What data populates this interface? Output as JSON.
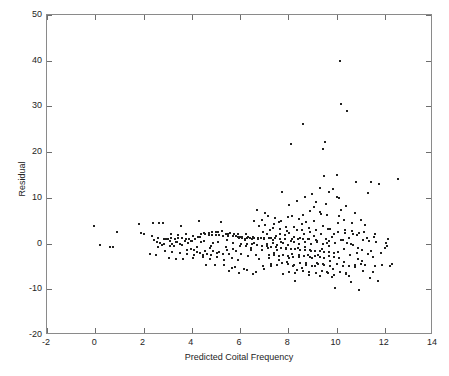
{
  "chart_data": {
    "type": "scatter",
    "title": "",
    "xlabel": "Predicted Coital Frequency",
    "ylabel": "Residual",
    "xlim": [
      -2,
      14
    ],
    "ylim": [
      -20,
      50
    ],
    "xticks": [
      -2,
      0,
      2,
      4,
      6,
      8,
      10,
      12,
      14
    ],
    "xticklabels": [
      "-2",
      "0",
      "2",
      "4",
      "6",
      "8",
      "10",
      "12",
      "14"
    ],
    "yticks": [
      -20,
      -10,
      0,
      10,
      20,
      30,
      40,
      50
    ],
    "yticklabels": [
      "-20",
      "-10",
      "0",
      "10",
      "20",
      "30",
      "40",
      "50"
    ],
    "grid": false,
    "legend": null,
    "marker": "point",
    "marker_color": "#20201f",
    "marker_size_px": 2,
    "axes_color": "#8a8a8a",
    "background": "#ffffff",
    "n_points": 420,
    "points": [
      [
        -0.05,
        3.8
      ],
      [
        0.2,
        -0.3
      ],
      [
        0.6,
        -0.7
      ],
      [
        0.75,
        -0.8
      ],
      [
        0.9,
        2.6
      ],
      [
        1.8,
        4.2
      ],
      [
        1.9,
        2.3
      ],
      [
        2.0,
        2.2
      ],
      [
        2.25,
        -2.3
      ],
      [
        2.35,
        1.7
      ],
      [
        2.4,
        4.4
      ],
      [
        2.45,
        0.8
      ],
      [
        2.5,
        -2.5
      ],
      [
        2.6,
        1.2
      ],
      [
        2.65,
        4.6
      ],
      [
        2.7,
        0.2
      ],
      [
        2.8,
        4.6
      ],
      [
        2.85,
        1.0
      ],
      [
        2.9,
        0.9
      ],
      [
        2.95,
        1.1
      ],
      [
        3.0,
        1.0
      ],
      [
        3.05,
        -3.2
      ],
      [
        3.1,
        0.6
      ],
      [
        3.15,
        1.3
      ],
      [
        3.2,
        -0.2
      ],
      [
        3.3,
        1.1
      ],
      [
        3.35,
        -3.4
      ],
      [
        3.4,
        0.3
      ],
      [
        3.45,
        1.2
      ],
      [
        3.5,
        0.0
      ],
      [
        3.55,
        3.8
      ],
      [
        3.6,
        1.3
      ],
      [
        3.65,
        -3.4
      ],
      [
        3.7,
        0.5
      ],
      [
        3.75,
        1.0
      ],
      [
        3.8,
        -1.4
      ],
      [
        3.9,
        0.9
      ],
      [
        3.95,
        -1.2
      ],
      [
        4.0,
        0.6
      ],
      [
        4.05,
        -3.2
      ],
      [
        4.1,
        -2.6
      ],
      [
        4.15,
        0.9
      ],
      [
        4.2,
        -1.9
      ],
      [
        4.3,
        5.0
      ],
      [
        4.35,
        -2.0
      ],
      [
        4.4,
        0.3
      ],
      [
        4.45,
        -2.4
      ],
      [
        4.5,
        2.3
      ],
      [
        4.55,
        -1.7
      ],
      [
        4.6,
        -4.6
      ],
      [
        4.65,
        -2.2
      ],
      [
        4.7,
        2.4
      ],
      [
        4.75,
        -1.0
      ],
      [
        4.8,
        -2.5
      ],
      [
        4.85,
        2.5
      ],
      [
        4.9,
        -1.6
      ],
      [
        4.95,
        -4.7
      ],
      [
        5.0,
        2.5
      ],
      [
        5.05,
        -2.1
      ],
      [
        5.1,
        2.6
      ],
      [
        5.15,
        -1.9
      ],
      [
        5.2,
        4.8
      ],
      [
        5.25,
        2.7
      ],
      [
        5.3,
        -2.3
      ],
      [
        5.35,
        -4.6
      ],
      [
        5.4,
        2.2
      ],
      [
        5.45,
        -1.5
      ],
      [
        5.5,
        2.2
      ],
      [
        5.55,
        -2.2
      ],
      [
        5.6,
        2.3
      ],
      [
        5.65,
        -5.4
      ],
      [
        5.7,
        -1.2
      ],
      [
        5.75,
        2.2
      ],
      [
        5.8,
        -5.2
      ],
      [
        5.85,
        -1.6
      ],
      [
        5.9,
        2.1
      ],
      [
        5.95,
        1.3
      ],
      [
        6.0,
        1.4
      ],
      [
        6.05,
        -2.2
      ],
      [
        6.1,
        1.3
      ],
      [
        6.15,
        -5.5
      ],
      [
        6.2,
        1.1
      ],
      [
        6.25,
        -0.6
      ],
      [
        6.3,
        1.3
      ],
      [
        6.35,
        -2.8
      ],
      [
        6.4,
        1.2
      ],
      [
        6.45,
        -1.3
      ],
      [
        6.5,
        1.1
      ],
      [
        6.55,
        -6.6
      ],
      [
        6.6,
        1.2
      ],
      [
        6.65,
        -2.6
      ],
      [
        6.7,
        7.4
      ],
      [
        6.75,
        1.1
      ],
      [
        6.8,
        -3.4
      ],
      [
        6.85,
        1.2
      ],
      [
        6.9,
        -1.4
      ],
      [
        6.95,
        -5.0
      ],
      [
        7.0,
        1.0
      ],
      [
        7.05,
        6.6
      ],
      [
        7.1,
        2.0
      ],
      [
        7.15,
        -1.0
      ],
      [
        7.2,
        -3.2
      ],
      [
        7.25,
        3.0
      ],
      [
        7.3,
        -5.0
      ],
      [
        7.35,
        0.8
      ],
      [
        7.4,
        -2.0
      ],
      [
        7.45,
        5.6
      ],
      [
        7.5,
        1.6
      ],
      [
        7.55,
        -1.4
      ],
      [
        7.6,
        -3.6
      ],
      [
        7.65,
        2.2
      ],
      [
        7.7,
        0.4
      ],
      [
        7.75,
        11.3
      ],
      [
        7.8,
        -6.6
      ],
      [
        7.85,
        1.8
      ],
      [
        7.9,
        -1.1
      ],
      [
        7.95,
        -4.0
      ],
      [
        8.0,
        5.8
      ],
      [
        8.05,
        2.4
      ],
      [
        8.1,
        0.6
      ],
      [
        8.12,
        21.7
      ],
      [
        8.15,
        -2.2
      ],
      [
        8.2,
        -4.8
      ],
      [
        8.25,
        1.4
      ],
      [
        8.3,
        -8.2
      ],
      [
        8.35,
        3.0
      ],
      [
        8.4,
        -1.0
      ],
      [
        8.45,
        -3.0
      ],
      [
        8.5,
        1.2
      ],
      [
        8.55,
        -5.4
      ],
      [
        8.6,
        6.2
      ],
      [
        8.62,
        26.2
      ],
      [
        8.65,
        2.0
      ],
      [
        8.7,
        -0.8
      ],
      [
        8.75,
        -4.2
      ],
      [
        8.8,
        1.0
      ],
      [
        8.85,
        -6.8
      ],
      [
        8.9,
        2.6
      ],
      [
        8.95,
        -1.6
      ],
      [
        9.0,
        -3.2
      ],
      [
        9.05,
        1.6
      ],
      [
        9.1,
        -5.0
      ],
      [
        9.15,
        9.2
      ],
      [
        9.2,
        0.4
      ],
      [
        9.25,
        -2.4
      ],
      [
        9.3,
        -7.0
      ],
      [
        9.35,
        2.2
      ],
      [
        9.4,
        -1.2
      ],
      [
        9.42,
        20.6
      ],
      [
        9.45,
        -4.4
      ],
      [
        9.5,
        14.7
      ],
      [
        9.52,
        22.2
      ],
      [
        9.55,
        1.0
      ],
      [
        9.6,
        -6.2
      ],
      [
        9.65,
        3.2
      ],
      [
        9.7,
        -0.6
      ],
      [
        9.75,
        -3.8
      ],
      [
        9.8,
        1.4
      ],
      [
        9.85,
        -5.6
      ],
      [
        9.9,
        2.0
      ],
      [
        9.95,
        -9.7
      ],
      [
        10.0,
        15.0
      ],
      [
        10.05,
        -1.8
      ],
      [
        10.1,
        9.9
      ],
      [
        10.15,
        40.0
      ],
      [
        10.2,
        30.5
      ],
      [
        10.25,
        0.8
      ],
      [
        10.3,
        -4.0
      ],
      [
        10.35,
        2.4
      ],
      [
        10.4,
        -6.6
      ],
      [
        10.45,
        29.0
      ],
      [
        10.5,
        1.2
      ],
      [
        10.55,
        -2.6
      ],
      [
        10.6,
        -8.4
      ],
      [
        10.65,
        4.4
      ],
      [
        10.7,
        -0.4
      ],
      [
        10.75,
        -5.2
      ],
      [
        10.8,
        13.4
      ],
      [
        10.85,
        1.8
      ],
      [
        10.9,
        -3.4
      ],
      [
        10.95,
        -10.2
      ],
      [
        11.0,
        5.2
      ],
      [
        11.05,
        -1.4
      ],
      [
        11.1,
        -6.0
      ],
      [
        11.15,
        2.6
      ],
      [
        11.2,
        -4.6
      ],
      [
        11.3,
        11.0
      ],
      [
        11.35,
        0.6
      ],
      [
        11.4,
        -7.6
      ],
      [
        11.45,
        13.5
      ],
      [
        11.5,
        -3.0
      ],
      [
        11.55,
        1.4
      ],
      [
        11.6,
        -5.0
      ],
      [
        11.7,
        -8.2
      ],
      [
        11.75,
        13.0
      ],
      [
        11.9,
        -4.6
      ],
      [
        12.05,
        0.2
      ],
      [
        12.1,
        -0.6
      ],
      [
        12.2,
        -5.0
      ],
      [
        12.55,
        14.2
      ],
      [
        2.55,
        0.4
      ],
      [
        2.75,
        -0.4
      ],
      [
        3.25,
        -0.6
      ],
      [
        3.85,
        0.2
      ],
      [
        4.25,
        1.5
      ],
      [
        4.9,
        0.2
      ],
      [
        5.45,
        0.8
      ],
      [
        5.9,
        -3.6
      ],
      [
        6.25,
        2.0
      ],
      [
        6.6,
        0.2
      ],
      [
        6.95,
        2.6
      ],
      [
        7.3,
        1.2
      ],
      [
        7.6,
        4.8
      ],
      [
        7.9,
        3.6
      ],
      [
        8.05,
        -3.2
      ],
      [
        8.35,
        -5.8
      ],
      [
        8.55,
        4.2
      ],
      [
        8.8,
        -2.4
      ],
      [
        9.05,
        5.0
      ],
      [
        9.2,
        -4.2
      ],
      [
        9.35,
        6.4
      ],
      [
        9.6,
        0.2
      ],
      [
        9.8,
        -7.4
      ],
      [
        10.05,
        4.6
      ],
      [
        10.3,
        -1.2
      ],
      [
        10.5,
        -7.2
      ],
      [
        10.7,
        2.0
      ],
      [
        10.9,
        -1.0
      ],
      [
        11.1,
        0.8
      ],
      [
        11.3,
        -2.2
      ],
      [
        6.05,
        -0.2
      ],
      [
        6.3,
        -0.2
      ],
      [
        6.5,
        -0.1
      ],
      [
        6.7,
        -0.3
      ],
      [
        6.9,
        -0.5
      ],
      [
        7.1,
        -0.6
      ],
      [
        7.3,
        -0.7
      ],
      [
        7.5,
        -0.8
      ],
      [
        7.7,
        -0.9
      ],
      [
        7.9,
        -1.0
      ],
      [
        8.1,
        -1.1
      ],
      [
        8.3,
        -1.2
      ],
      [
        8.5,
        -1.3
      ],
      [
        8.7,
        -1.4
      ],
      [
        8.9,
        -1.5
      ],
      [
        9.1,
        -1.6
      ],
      [
        9.3,
        -1.7
      ],
      [
        9.5,
        -1.8
      ],
      [
        9.7,
        -1.9
      ],
      [
        9.9,
        -2.0
      ],
      [
        5.9,
        1.5
      ],
      [
        6.1,
        1.5
      ],
      [
        6.35,
        1.4
      ],
      [
        6.55,
        1.4
      ],
      [
        6.75,
        1.3
      ],
      [
        7.0,
        1.3
      ],
      [
        7.2,
        1.2
      ],
      [
        7.45,
        1.2
      ],
      [
        7.65,
        1.1
      ],
      [
        7.85,
        1.1
      ],
      [
        8.15,
        1.0
      ],
      [
        8.4,
        1.0
      ],
      [
        8.6,
        0.9
      ],
      [
        8.85,
        0.9
      ],
      [
        9.15,
        0.8
      ],
      [
        4.7,
        1.9
      ],
      [
        4.85,
        1.9
      ],
      [
        5.0,
        1.8
      ],
      [
        5.15,
        1.8
      ],
      [
        5.3,
        1.7
      ],
      [
        5.5,
        1.7
      ],
      [
        5.7,
        1.6
      ],
      [
        5.85,
        1.6
      ],
      [
        4.55,
        2.0
      ],
      [
        4.4,
        2.0
      ],
      [
        7.2,
        -2.4
      ],
      [
        7.4,
        -2.6
      ],
      [
        7.6,
        -2.8
      ],
      [
        7.8,
        -2.5
      ],
      [
        8.0,
        -2.7
      ],
      [
        8.2,
        -2.9
      ],
      [
        8.45,
        -2.6
      ],
      [
        8.65,
        -2.8
      ],
      [
        8.9,
        -3.0
      ],
      [
        9.1,
        -2.7
      ],
      [
        9.3,
        -2.9
      ],
      [
        9.5,
        -3.1
      ],
      [
        9.7,
        -2.8
      ],
      [
        9.9,
        -3.0
      ],
      [
        10.1,
        -3.2
      ],
      [
        7.3,
        -4.4
      ],
      [
        7.55,
        -4.6
      ],
      [
        7.75,
        -4.2
      ],
      [
        8.0,
        -4.5
      ],
      [
        8.25,
        -4.7
      ],
      [
        8.5,
        -4.3
      ],
      [
        8.75,
        -4.6
      ],
      [
        9.0,
        -4.8
      ],
      [
        9.25,
        -4.4
      ],
      [
        9.5,
        -4.7
      ],
      [
        9.75,
        -4.9
      ],
      [
        10.0,
        -4.5
      ],
      [
        10.25,
        -4.8
      ],
      [
        10.5,
        -5.0
      ],
      [
        10.75,
        -4.6
      ],
      [
        8.05,
        -6.2
      ],
      [
        8.3,
        -6.4
      ],
      [
        8.6,
        -6.0
      ],
      [
        8.85,
        -6.3
      ],
      [
        9.15,
        -6.5
      ],
      [
        9.4,
        -6.1
      ],
      [
        9.65,
        -6.4
      ],
      [
        9.9,
        -6.8
      ],
      [
        10.15,
        -6.2
      ],
      [
        10.4,
        -6.5
      ],
      [
        7.1,
        -0.2
      ],
      [
        7.35,
        0.1
      ],
      [
        7.55,
        -0.4
      ],
      [
        7.8,
        0.2
      ],
      [
        8.0,
        -0.3
      ],
      [
        8.25,
        0.3
      ],
      [
        8.45,
        -0.2
      ],
      [
        8.7,
        0.4
      ],
      [
        8.95,
        -0.1
      ],
      [
        9.2,
        0.5
      ],
      [
        9.45,
        0.0
      ],
      [
        9.7,
        0.6
      ],
      [
        9.95,
        0.1
      ],
      [
        10.2,
        0.7
      ],
      [
        10.45,
        0.2
      ],
      [
        6.8,
        3.8
      ],
      [
        7.05,
        4.0
      ],
      [
        7.35,
        3.4
      ],
      [
        7.65,
        3.2
      ],
      [
        7.95,
        2.8
      ],
      [
        8.25,
        3.6
      ],
      [
        8.55,
        2.9
      ],
      [
        8.85,
        3.4
      ],
      [
        9.15,
        3.0
      ],
      [
        9.45,
        3.8
      ],
      [
        9.75,
        3.2
      ],
      [
        10.05,
        2.6
      ],
      [
        10.35,
        3.0
      ],
      [
        10.65,
        2.8
      ],
      [
        10.95,
        2.4
      ],
      [
        8.9,
        7.2
      ],
      [
        9.3,
        6.8
      ],
      [
        9.6,
        6.2
      ],
      [
        9.05,
        8.0
      ],
      [
        9.55,
        8.6
      ],
      [
        8.15,
        6.0
      ],
      [
        8.45,
        5.4
      ],
      [
        8.75,
        4.8
      ],
      [
        10.1,
        6.0
      ],
      [
        10.3,
        5.2
      ],
      [
        3.15,
        2.0
      ],
      [
        3.45,
        1.8
      ],
      [
        3.75,
        2.0
      ],
      [
        4.05,
        1.6
      ],
      [
        4.35,
        1.4
      ],
      [
        2.9,
        -1.6
      ],
      [
        3.2,
        -1.8
      ],
      [
        3.5,
        -2.0
      ],
      [
        3.8,
        -2.2
      ],
      [
        4.1,
        -1.4
      ],
      [
        4.45,
        -3.0
      ],
      [
        4.75,
        -3.4
      ],
      [
        5.05,
        -3.0
      ],
      [
        5.35,
        -3.6
      ],
      [
        5.65,
        -3.2
      ],
      [
        2.6,
        -0.8
      ],
      [
        2.85,
        0.0
      ],
      [
        3.1,
        -0.5
      ],
      [
        3.35,
        0.4
      ],
      [
        3.6,
        -0.3
      ],
      [
        3.95,
        0.5
      ],
      [
        4.2,
        -0.7
      ],
      [
        4.5,
        0.6
      ],
      [
        4.8,
        -0.5
      ],
      [
        5.1,
        0.4
      ],
      [
        5.4,
        -0.8
      ],
      [
        5.7,
        0.2
      ],
      [
        6.0,
        -0.6
      ],
      [
        6.2,
        0.8
      ],
      [
        6.45,
        -1.0
      ],
      [
        10.6,
        -0.2
      ],
      [
        10.85,
        -2.0
      ],
      [
        11.05,
        -3.8
      ],
      [
        11.25,
        1.2
      ],
      [
        11.45,
        -1.6
      ],
      [
        11.6,
        2.2
      ],
      [
        11.85,
        -2.0
      ],
      [
        12.0,
        -1.0
      ],
      [
        12.15,
        1.0
      ],
      [
        12.3,
        -4.4
      ],
      [
        10.75,
        6.6
      ],
      [
        11.0,
        -4.4
      ],
      [
        11.2,
        4.0
      ],
      [
        11.5,
        -6.2
      ],
      [
        11.65,
        0.4
      ],
      [
        6.6,
        5.0
      ],
      [
        6.9,
        5.2
      ],
      [
        7.15,
        6.0
      ],
      [
        7.4,
        4.2
      ],
      [
        7.7,
        5.0
      ],
      [
        5.55,
        -6.0
      ],
      [
        5.95,
        -6.4
      ],
      [
        6.3,
        -5.8
      ],
      [
        6.65,
        -6.2
      ],
      [
        7.0,
        -5.6
      ],
      [
        9.85,
        12.0
      ],
      [
        10.0,
        10.2
      ],
      [
        9.7,
        11.2
      ],
      [
        10.4,
        8.2
      ],
      [
        10.2,
        7.4
      ],
      [
        8.35,
        9.4
      ],
      [
        8.05,
        8.4
      ],
      [
        8.7,
        10.2
      ],
      [
        9.0,
        10.8
      ],
      [
        9.3,
        12.2
      ]
    ]
  },
  "axes": {
    "xlabel": "Predicted Coital Frequency",
    "ylabel": "Residual"
  }
}
